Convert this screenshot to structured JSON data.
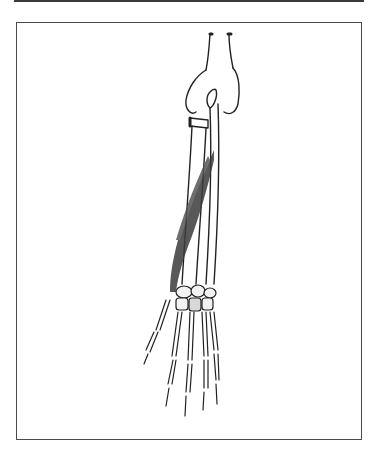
{
  "figure": {
    "colors": {
      "frame": "#4a4a4a",
      "bone_outline": "#222222",
      "muscle": "#3c3c3c",
      "background": "#ffffff"
    }
  }
}
